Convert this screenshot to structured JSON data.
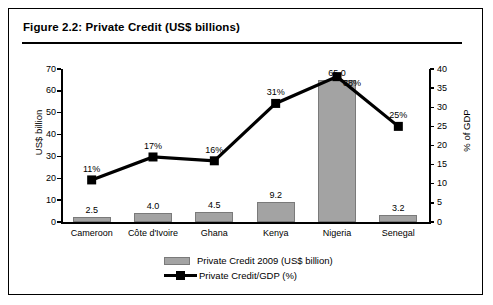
{
  "figure": {
    "title": "Figure 2.2: Private Credit (US$ billions)"
  },
  "chart_data": {
    "type": "bar",
    "title": "Figure 2.2: Private Credit (US$ billions)",
    "xlabel": "",
    "ylabel": "US$ billion",
    "y2label": "% of GDP",
    "ylim": [
      0,
      70
    ],
    "y2lim": [
      0,
      40
    ],
    "yticks": [
      "0",
      "10",
      "20",
      "30",
      "40",
      "50",
      "60",
      "70"
    ],
    "y2ticks": [
      "0",
      "5",
      "10",
      "15",
      "20",
      "25",
      "30",
      "35",
      "40"
    ],
    "grid": false,
    "legend_position": "bottom",
    "categories": [
      "Cameroon",
      "Côte d'Ivoire",
      "Ghana",
      "Kenya",
      "Nigeria",
      "Senegal"
    ],
    "series": [
      {
        "name": "Private Credit 2009 (US$ billion)",
        "type": "bar",
        "axis": "left",
        "color": "#a3a3a3",
        "values": [
          2.5,
          4.0,
          4.5,
          9.2,
          65.0,
          3.2
        ],
        "labels": [
          "2.5",
          "4.0",
          "4.5",
          "9.2",
          "65.0",
          "3.2"
        ]
      },
      {
        "name": "Private Credit/GDP (%)",
        "type": "line",
        "axis": "right",
        "color": "#000000",
        "values": [
          11,
          17,
          16,
          31,
          38,
          25
        ],
        "labels": [
          "11%",
          "17%",
          "16%",
          "31%",
          "38%",
          "25%"
        ]
      }
    ]
  },
  "legend": {
    "items": [
      {
        "label": "Private Credit 2009 (US$ billion)",
        "marker": "bar-swatch"
      },
      {
        "label": "Private Credit/GDP (%)",
        "marker": "line-marker"
      }
    ]
  }
}
